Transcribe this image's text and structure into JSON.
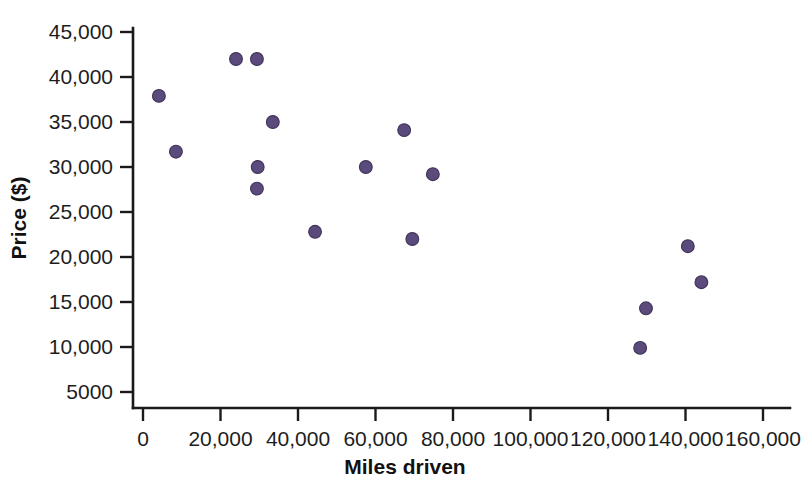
{
  "chart_data": {
    "type": "scatter",
    "title": "",
    "xlabel": "Miles driven",
    "ylabel": "Price ($)",
    "xlim": [
      0,
      165000
    ],
    "ylim": [
      5000,
      46500
    ],
    "grid": false,
    "legend": false,
    "point_color": "#5a4b7c",
    "x_ticks": [
      0,
      20000,
      40000,
      60000,
      80000,
      100000,
      120000,
      140000,
      160000
    ],
    "x_tick_labels": [
      "0",
      "20,000",
      "40,000",
      "60,000",
      "80,000",
      "100,000",
      "120,000",
      "140,000",
      "160,000"
    ],
    "y_ticks": [
      5000,
      10000,
      15000,
      20000,
      25000,
      30000,
      35000,
      40000,
      45000
    ],
    "y_tick_labels": [
      "5000",
      "10,000",
      "15,000",
      "20,000",
      "25,000",
      "30,000",
      "35,000",
      "40,000",
      "45,000"
    ],
    "points": [
      {
        "x": 4100,
        "y": 37900
      },
      {
        "x": 8500,
        "y": 31700
      },
      {
        "x": 24000,
        "y": 42000
      },
      {
        "x": 29400,
        "y": 42000
      },
      {
        "x": 29600,
        "y": 30000
      },
      {
        "x": 29400,
        "y": 27600
      },
      {
        "x": 33500,
        "y": 35000
      },
      {
        "x": 44400,
        "y": 22800
      },
      {
        "x": 57500,
        "y": 30000
      },
      {
        "x": 67400,
        "y": 34100
      },
      {
        "x": 69500,
        "y": 22000
      },
      {
        "x": 74800,
        "y": 29200
      },
      {
        "x": 128300,
        "y": 9900
      },
      {
        "x": 129800,
        "y": 14300
      },
      {
        "x": 140600,
        "y": 21200
      },
      {
        "x": 144100,
        "y": 17200
      }
    ]
  },
  "axes": {
    "x_axis_name": "Miles driven",
    "y_axis_name": "Price ($)"
  }
}
